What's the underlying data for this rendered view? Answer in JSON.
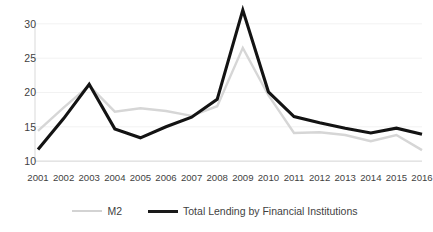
{
  "chart_data": {
    "type": "line",
    "title": "",
    "subtitle": "",
    "xlabel": "",
    "ylabel": "",
    "categories": [
      "2001",
      "2002",
      "2003",
      "2004",
      "2005",
      "2006",
      "2007",
      "2008",
      "2009",
      "2010",
      "2011",
      "2012",
      "2013",
      "2014",
      "2015",
      "2016"
    ],
    "series": [
      {
        "name": "M2",
        "color": "#d6d6d6",
        "values": [
          14.4,
          17.8,
          21.0,
          17.2,
          17.7,
          17.3,
          16.6,
          18.0,
          26.5,
          19.6,
          14.1,
          14.2,
          13.8,
          12.9,
          13.8,
          11.6
        ]
      },
      {
        "name": "Total Lending by Financial Institutions",
        "color": "#131313",
        "values": [
          11.7,
          16.2,
          21.2,
          14.7,
          13.4,
          15.0,
          16.4,
          19.0,
          32.0,
          20.1,
          16.5,
          15.6,
          14.8,
          14.1,
          14.8,
          13.9
        ]
      }
    ],
    "yticks": [
      10,
      15,
      20,
      25,
      30
    ],
    "ytick_labels": [
      "10",
      "15",
      "20",
      "25",
      "30"
    ],
    "ylim": [
      9.0,
      32.6
    ],
    "grid": true,
    "legend_position": "bottom"
  },
  "legend": {
    "entries": [
      {
        "label": "M2",
        "style": "m2"
      },
      {
        "label": "Total Lending by Financial Institutions",
        "style": "lending"
      }
    ]
  }
}
